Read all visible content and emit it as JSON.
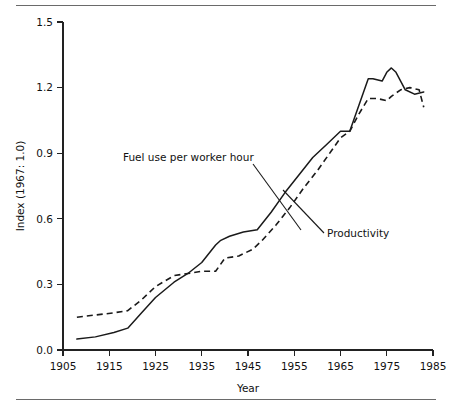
{
  "figure": {
    "has_top_rule": true,
    "has_bottom_rule": true,
    "background_color": "#ffffff",
    "ink_color": "#1a1a1a"
  },
  "chart_data": {
    "type": "line",
    "title": "",
    "xlabel": "Year",
    "ylabel": "Index (1967: 1.0)",
    "xlim": [
      1905,
      1985
    ],
    "ylim": [
      0.0,
      1.5
    ],
    "xticks": [
      1905,
      1915,
      1925,
      1935,
      1945,
      1955,
      1965,
      1975,
      1985
    ],
    "xticklabels": [
      "1905",
      "1915",
      "1925",
      "1935",
      "1945",
      "1955",
      "1965",
      "1975",
      "1985"
    ],
    "yticks": [
      0.0,
      0.3,
      0.6,
      0.9,
      1.2,
      1.5
    ],
    "yticklabels": [
      "0.0",
      "0.3",
      "0.6",
      "0.9",
      "1.2",
      "1.5"
    ],
    "grid": false,
    "legend_position": "inline-annotations",
    "series": [
      {
        "name": "Fuel use per worker hour",
        "style": "solid",
        "x": [
          1908,
          1912,
          1916,
          1919,
          1922,
          1925,
          1929,
          1932,
          1935,
          1938,
          1939,
          1941,
          1944,
          1947,
          1950,
          1953,
          1956,
          1959,
          1962,
          1965,
          1967,
          1969,
          1971,
          1972,
          1974,
          1975,
          1976,
          1977,
          1979,
          1981,
          1983
        ],
        "y": [
          0.05,
          0.06,
          0.08,
          0.1,
          0.17,
          0.24,
          0.31,
          0.35,
          0.4,
          0.48,
          0.5,
          0.52,
          0.54,
          0.55,
          0.63,
          0.72,
          0.8,
          0.88,
          0.94,
          1.0,
          1.0,
          1.12,
          1.24,
          1.24,
          1.23,
          1.27,
          1.29,
          1.27,
          1.19,
          1.17,
          1.18
        ]
      },
      {
        "name": "Productivity",
        "style": "dashed",
        "x": [
          1908,
          1912,
          1916,
          1919,
          1922,
          1925,
          1929,
          1932,
          1935,
          1938,
          1940,
          1943,
          1946,
          1948,
          1951,
          1954,
          1957,
          1960,
          1963,
          1965,
          1967,
          1969,
          1971,
          1973,
          1975,
          1976,
          1978,
          1980,
          1982,
          1983
        ],
        "y": [
          0.15,
          0.16,
          0.17,
          0.18,
          0.23,
          0.29,
          0.34,
          0.35,
          0.36,
          0.36,
          0.42,
          0.43,
          0.46,
          0.5,
          0.57,
          0.65,
          0.74,
          0.82,
          0.91,
          0.97,
          1.0,
          1.08,
          1.15,
          1.15,
          1.14,
          1.16,
          1.19,
          1.2,
          1.19,
          1.11
        ]
      }
    ],
    "annotations": [
      {
        "text": "Fuel use per worker hour",
        "points_to_series": "Fuel use per worker hour",
        "label_x": 123,
        "label_y": 161,
        "leader_from_x": 253,
        "leader_from_y": 164,
        "leader_to_x": 301,
        "leader_to_y": 230
      },
      {
        "text": "Productivity",
        "points_to_series": "Productivity",
        "label_x": 327,
        "label_y": 237,
        "leader_from_x": 324,
        "leader_from_y": 233,
        "leader_to_x": 283,
        "leader_to_y": 190
      }
    ]
  }
}
